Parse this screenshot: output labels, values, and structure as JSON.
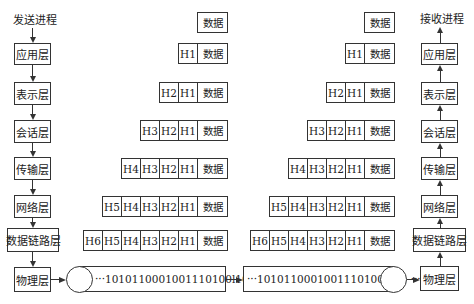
{
  "sender": {
    "title": "发送进程",
    "layers": [
      "应用层",
      "表示层",
      "会话层",
      "传输层",
      "网络层",
      "数据链路层",
      "物理层"
    ]
  },
  "receiver": {
    "title": "接收进程",
    "layers": [
      "应用层",
      "表示层",
      "会话层",
      "传输层",
      "网络层",
      "数据链路层",
      "物理层"
    ]
  },
  "data_label": "数据",
  "headers": [
    "H1",
    "H2",
    "H3",
    "H4",
    "H5",
    "H6"
  ],
  "bitstream": {
    "left": "···1010110001001110100l101 ···",
    "right": "···1010110001001110100l101 ···"
  },
  "packets": {
    "row0": [
      "数据"
    ],
    "row1": [
      "H1",
      "数据"
    ],
    "row2": [
      "H2",
      "H1",
      "数据"
    ],
    "row3": [
      "H3",
      "H2",
      "H1",
      "数据"
    ],
    "row4": [
      "H4",
      "H3",
      "H2",
      "H1",
      "数据"
    ],
    "row5": [
      "H5",
      "H4",
      "H3",
      "H2",
      "H1",
      "数据"
    ],
    "row6": [
      "H6",
      "H5",
      "H4",
      "H3",
      "H2",
      "H1",
      "数据"
    ]
  }
}
